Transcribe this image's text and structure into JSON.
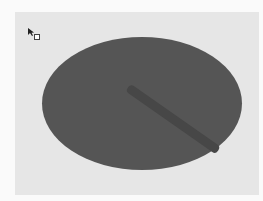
{
  "canvas": {
    "background_color": "#e6e6e6",
    "shapes": [
      {
        "type": "ellipse",
        "fill": "#555555"
      },
      {
        "type": "brush-stroke",
        "fill": "#474747"
      }
    ]
  },
  "cursor": {
    "icon": "arrow-cursor-with-selection-box"
  }
}
